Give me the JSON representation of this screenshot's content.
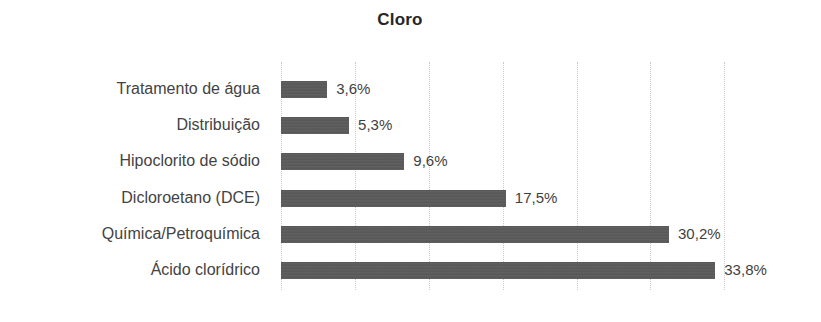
{
  "chart_data": {
    "type": "bar",
    "orientation": "horizontal",
    "title": "Cloro",
    "xlabel": "",
    "ylabel": "",
    "categories": [
      "Tratamento de água",
      "Distribuição",
      "Hipoclorito de sódio",
      "Dicloroetano (DCE)",
      "Química/Petroquímica",
      "Ácido clorídrico"
    ],
    "values": [
      3.6,
      5.3,
      9.6,
      17.5,
      30.2,
      33.8
    ],
    "value_labels": [
      "3,6%",
      "5,3%",
      "9,6%",
      "17,5%",
      "30,2%",
      "33,8%"
    ],
    "xlim": [
      0,
      35.1
    ],
    "grid": true,
    "grid_axis": "x",
    "gridline_values": [
      0,
      5.75,
      11.5,
      17.25,
      23.0,
      28.75,
      34.5
    ],
    "legend": "none",
    "bar_color": "#595959",
    "grid_color": "#c9c9c9",
    "label_color": "#434343",
    "value_label_color": "#3f3f3f",
    "title_color": "#262626",
    "background_color": "#ffffff"
  }
}
